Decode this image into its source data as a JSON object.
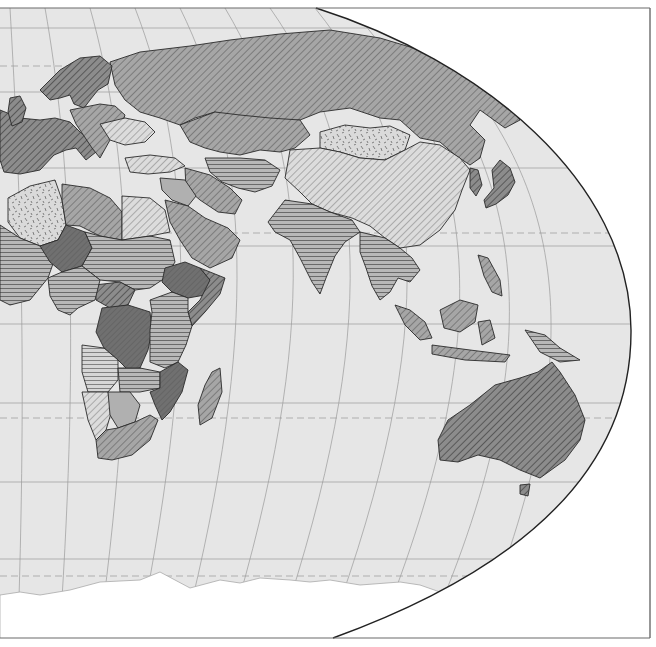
{
  "map": {
    "type": "choropleth",
    "projection": "robinson-like (eastern hemisphere crop)",
    "colors": {
      "ocean": "#e6e6e6",
      "outside": "#ffffff",
      "frame": "#6b6b6b",
      "border": "#2a2a2a",
      "graticule": "#9a9a9a",
      "antarctica": "#ffffff"
    },
    "legend_visible": false,
    "pattern_classes": [
      {
        "id": "p-dark-solid",
        "description": "dark gray solid/dense hatch",
        "fill": "#6e6e6e"
      },
      {
        "id": "p-dark-diag",
        "description": "dark gray diagonal hatch",
        "fill": "#8a8a8a"
      },
      {
        "id": "p-mid-diag",
        "description": "medium gray diagonal hatch",
        "fill": "#a3a3a3"
      },
      {
        "id": "p-light-diag",
        "description": "light diagonal hatch",
        "fill": "#d4d4d4"
      },
      {
        "id": "p-horiz",
        "description": "horizontal line hatch",
        "fill": "#b5b5b5"
      },
      {
        "id": "p-light-horiz",
        "description": "light horizontal hatch",
        "fill": "#d0d0d0"
      },
      {
        "id": "p-dashes",
        "description": "random dash texture",
        "fill": "#d8d8d8"
      },
      {
        "id": "p-plain",
        "description": "plain light gray",
        "fill": "#b0b0b0"
      }
    ],
    "regions": [
      {
        "name": "russia",
        "pattern": "p-mid-diag"
      },
      {
        "name": "china",
        "pattern": "p-light-diag"
      },
      {
        "name": "mongolia",
        "pattern": "p-dashes"
      },
      {
        "name": "kazakhstan",
        "pattern": "p-mid-diag"
      },
      {
        "name": "scandinavia",
        "pattern": "p-dark-diag"
      },
      {
        "name": "western-europe",
        "pattern": "p-dark-diag"
      },
      {
        "name": "eastern-europe",
        "pattern": "p-mid-diag"
      },
      {
        "name": "ukraine",
        "pattern": "p-light-diag"
      },
      {
        "name": "turkey",
        "pattern": "p-light-diag"
      },
      {
        "name": "middle-east",
        "pattern": "p-mid-diag"
      },
      {
        "name": "arabian-peninsula",
        "pattern": "p-mid-diag"
      },
      {
        "name": "iran",
        "pattern": "p-mid-diag"
      },
      {
        "name": "central-asia",
        "pattern": "p-horiz"
      },
      {
        "name": "india",
        "pattern": "p-horiz"
      },
      {
        "name": "southeast-asia",
        "pattern": "p-horiz"
      },
      {
        "name": "indonesia",
        "pattern": "p-mid-diag"
      },
      {
        "name": "japan",
        "pattern": "p-dark-diag"
      },
      {
        "name": "korea",
        "pattern": "p-dark-diag"
      },
      {
        "name": "australia",
        "pattern": "p-dark-diag"
      },
      {
        "name": "new-zealand",
        "pattern": "p-dark-diag"
      },
      {
        "name": "papua-new-guinea",
        "pattern": "p-horiz"
      },
      {
        "name": "algeria",
        "pattern": "p-dashes"
      },
      {
        "name": "libya",
        "pattern": "p-mid-diag"
      },
      {
        "name": "egypt",
        "pattern": "p-light-diag"
      },
      {
        "name": "sahel-west",
        "pattern": "p-horiz"
      },
      {
        "name": "niger",
        "pattern": "p-dark-solid"
      },
      {
        "name": "chad-sudan",
        "pattern": "p-horiz"
      },
      {
        "name": "ethiopia",
        "pattern": "p-dark-solid"
      },
      {
        "name": "somalia",
        "pattern": "p-dark-diag"
      },
      {
        "name": "central-african-rep",
        "pattern": "p-dark-diag"
      },
      {
        "name": "dr-congo",
        "pattern": "p-dark-solid"
      },
      {
        "name": "east-africa",
        "pattern": "p-horiz"
      },
      {
        "name": "angola",
        "pattern": "p-light-horiz"
      },
      {
        "name": "zambia",
        "pattern": "p-horiz"
      },
      {
        "name": "mozambique",
        "pattern": "p-dark-solid"
      },
      {
        "name": "namibia",
        "pattern": "p-light-diag"
      },
      {
        "name": "botswana",
        "pattern": "p-plain"
      },
      {
        "name": "south-africa",
        "pattern": "p-mid-diag"
      },
      {
        "name": "madagascar",
        "pattern": "p-mid-diag"
      }
    ]
  }
}
